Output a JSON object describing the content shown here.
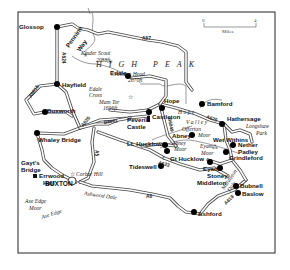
{
  "map": {
    "region_label": "HIGH PEAK",
    "scale": {
      "start": "0",
      "end": "4",
      "unit": "Miles"
    },
    "towns": [
      {
        "id": "glossop",
        "name": "Glossop"
      },
      {
        "id": "hayfield",
        "name": "Hayfield"
      },
      {
        "id": "edale",
        "name": "Edale"
      },
      {
        "id": "bamford",
        "name": "Bamford"
      },
      {
        "id": "buxworth",
        "name": "Buxworth"
      },
      {
        "id": "whaley-bridge",
        "name": "Whaley Bridge"
      },
      {
        "id": "castleton",
        "name": "Castleton"
      },
      {
        "id": "hope",
        "name": "Hope"
      },
      {
        "id": "hathersage",
        "name": "Hathersage"
      },
      {
        "id": "abney",
        "name": "Abney"
      },
      {
        "id": "lt-hucklow",
        "name": "Lt. Hucklow"
      },
      {
        "id": "gt-hucklow",
        "name": "Gt Hucklow"
      },
      {
        "id": "tideswell",
        "name": "Tideswell"
      },
      {
        "id": "eyam",
        "name": "Eyam"
      },
      {
        "id": "stoney-middleton",
        "name": "Stoney Middleton"
      },
      {
        "id": "wet-withins",
        "name": "Wet Withins"
      },
      {
        "id": "nether-padley",
        "name": "Nether Padley"
      },
      {
        "id": "grindleford",
        "name": "Grindleford"
      },
      {
        "id": "bubnell",
        "name": "Bubnell"
      },
      {
        "id": "baslow",
        "name": "Baslow"
      },
      {
        "id": "ashford",
        "name": "Ashford"
      },
      {
        "id": "buxton",
        "name": "BUXTON"
      }
    ],
    "labels": {
      "glossop": "Glossop",
      "hayfield": "Hayfield",
      "edale": "Edale",
      "bamford": "Bamford",
      "buxworth": "Buxworth",
      "whaley_bridge": "Whaley Bridge",
      "castleton": "Castleton",
      "hope": "Hope",
      "hathersage": "Hathersage",
      "abney": "Abney",
      "lt_hucklow": "Lt. Hucklow",
      "gt_hucklow": "Gt Hucklow",
      "tideswell": "Tideswell",
      "eyam": "Eyam",
      "stoney": "Stoney",
      "middleton": "Middleton",
      "wet_withins": "Wet Withins",
      "nether": "Nether",
      "padley": "Padley",
      "grindleford": "Grindleford",
      "bubnell": "Bubnell",
      "baslow": "Baslow",
      "ashford": "Ashford",
      "buxton": "BUXTON",
      "gayts": "Gayt's",
      "bridge": "Bridge",
      "errwood": "Errwood",
      "hall": "Hall",
      "peveril": "Peveril",
      "castle": "Castle"
    },
    "features": {
      "pennine_way_1": "Pennine",
      "pennine_way_2": "Way",
      "kinder_scout": "Kinder Scout",
      "kinder_height": "2088ft",
      "crowden_head": "Crowden Head",
      "crowden_height": "2070ft",
      "edale_cross_1": "Edale",
      "edale_cross_2": "Cross",
      "mam_tor": "Mam Tor",
      "mam_tor_height": "1696ft",
      "hope_valley_1": "H o p e",
      "hope_valley_2": "V a l l e y",
      "offerton_moor_1": "Offerton",
      "offerton_moor_2": "Moor",
      "abney_moor_1": "Abney",
      "abney_moor_2": "Moor",
      "eyam_moor_1": "Eyam",
      "eyam_moor_2": "Moor",
      "longshaw_park_1": "Longshaw",
      "longshaw_park_2": "Park",
      "combs_hill": "Corbar Hill",
      "ashwood_dale": "Ashwood Dale",
      "axe_edge_moor_1": "Axe Edge",
      "axe_edge_moor_2": "Moor",
      "axe_edge": "Axe Edge",
      "bradwell_dale": "Bradwell",
      "middleton_dale_1": "Middleton",
      "middleton_dale_2": "Dale"
    },
    "roads": {
      "a57": "A57",
      "a624": "A624",
      "a6015": "A6015",
      "a625": "A625",
      "b6061": "B6061",
      "a6187": "A6187",
      "a623": "A623",
      "a6": "A6",
      "a5": "A5",
      "a619": "A619",
      "b6049": "B6049"
    }
  }
}
